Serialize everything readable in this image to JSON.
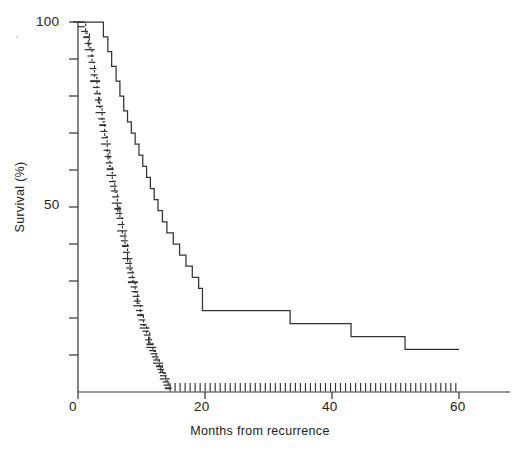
{
  "figure": {
    "kind": "kaplan-meier-survival-plot",
    "background": "#ffffff",
    "line_color": "#333333",
    "text_color": "#222222"
  },
  "axes": {
    "x_title": "Months from recurrence",
    "y_title": "Survival (%)",
    "x_tick_labels": [
      "0",
      "20",
      "40",
      "60"
    ],
    "y_tick_labels": [
      "100",
      "50"
    ]
  },
  "chart_data": {
    "type": "line",
    "title": "",
    "subtitle": "",
    "xlabel": "Months from recurrence",
    "ylabel": "Survival (%)",
    "xlim": [
      0,
      64
    ],
    "ylim": [
      0,
      100
    ],
    "xticks": [
      0,
      20,
      40,
      60
    ],
    "xticks_labeled": [
      0,
      20,
      40,
      60
    ],
    "yticks": [
      0,
      10,
      20,
      30,
      40,
      50,
      60,
      70,
      80,
      90,
      100
    ],
    "yticks_labeled": [
      50,
      100
    ],
    "grid": false,
    "legend": "none",
    "legend_position": "none",
    "step_style": "post",
    "annotations": [],
    "series": [
      {
        "name": "curve-1",
        "style": "solid-step",
        "description": "Main survival staircase descending from 100% to about 10% by 60 months",
        "x": [
          0,
          3.0,
          4.0,
          4.7,
          5.3,
          6.0,
          6.6,
          7.2,
          7.8,
          8.4,
          9.0,
          9.6,
          10.2,
          10.8,
          11.4,
          12.0,
          12.6,
          13.3,
          14.0,
          15.0,
          16.0,
          17.0,
          18.0,
          19.0,
          19.6,
          32.5,
          33.4,
          42.0,
          43.0,
          46.5,
          51.5,
          60.0
        ],
        "y": [
          100,
          100,
          96,
          92,
          88,
          84,
          80,
          76,
          73,
          70,
          67,
          64,
          61,
          58,
          55,
          52,
          49,
          46,
          43,
          40,
          37,
          34,
          31,
          28,
          22,
          22,
          18.5,
          18.5,
          15,
          15,
          11.5,
          11.5
        ]
      },
      {
        "name": "curve-2",
        "style": "dashed-step-with-censor-ticks",
        "description": "Second steeply falling staircase reaching zero survival by about 14 months, drawn as dense short dashes with censoring ticks",
        "x": [
          0,
          1.2,
          1.8,
          2.2,
          2.6,
          3.0,
          3.4,
          3.8,
          4.2,
          4.6,
          5.0,
          5.4,
          5.8,
          6.2,
          6.6,
          7.0,
          7.4,
          7.8,
          8.2,
          8.6,
          9.0,
          9.4,
          9.8,
          10.3,
          10.8,
          11.3,
          11.8,
          12.3,
          12.8,
          13.3,
          13.8,
          14.2
        ],
        "y": [
          100,
          97,
          93,
          89,
          85,
          81,
          77,
          73,
          69,
          65,
          61,
          57,
          54,
          50,
          47,
          43,
          40,
          36,
          33,
          30,
          27,
          24,
          21,
          18,
          16,
          13,
          11,
          9,
          7,
          5,
          3,
          1
        ]
      }
    ],
    "censoring_marks": {
      "axis_baseline_count": 58,
      "axis_baseline_from_month": 14.5,
      "axis_baseline_to_month": 59.5,
      "note": "Short vertical censoring ticks sit on the zero-survival baseline between about 14 and 60 months"
    }
  }
}
